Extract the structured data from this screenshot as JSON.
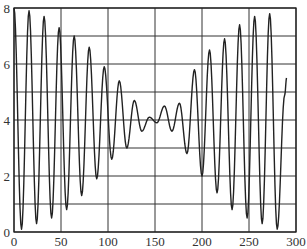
{
  "chart_data": {
    "type": "line",
    "title": "",
    "xlabel": "",
    "ylabel": "",
    "xlim": [
      0,
      300
    ],
    "ylim": [
      0,
      8
    ],
    "grid": true,
    "legend": null,
    "x_ticks": [
      0,
      50,
      100,
      150,
      200,
      250,
      300
    ],
    "y_ticks": [
      0,
      2,
      4,
      6,
      8
    ],
    "y_gridlines": [
      0,
      1,
      2,
      3,
      4,
      5,
      6,
      7,
      8
    ],
    "x_gridlines": [
      0,
      50,
      100,
      150,
      200,
      250,
      300
    ],
    "series": [
      {
        "name": "signal",
        "color": "#222222",
        "x": [
          0,
          8,
          16,
          24,
          32,
          40,
          48,
          56,
          64,
          72,
          80,
          88,
          96,
          104,
          112,
          120,
          128,
          136,
          144,
          152,
          160,
          168,
          176,
          184,
          192,
          200,
          208,
          216,
          224,
          232,
          240,
          248,
          256,
          264,
          272,
          280,
          288,
          290
        ],
        "y": [
          8.0,
          0.1,
          7.9,
          0.3,
          7.7,
          0.5,
          7.3,
          0.8,
          7.0,
          1.3,
          6.6,
          1.9,
          5.9,
          2.6,
          5.4,
          3.0,
          4.7,
          3.6,
          4.1,
          3.9,
          4.5,
          3.6,
          4.6,
          2.8,
          5.8,
          2.0,
          6.5,
          1.4,
          6.9,
          0.8,
          7.4,
          0.5,
          7.7,
          0.3,
          7.8,
          0.1,
          4.9,
          5.5
        ]
      }
    ]
  }
}
